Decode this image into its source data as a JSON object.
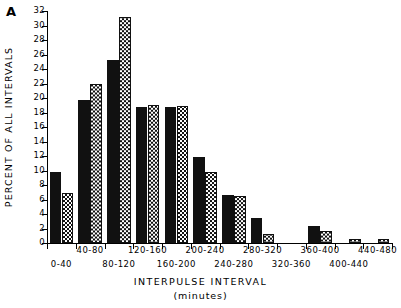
{
  "panel": {
    "label": "A"
  },
  "axes": {
    "ylabel": "PERCENT OF ALL INTERVALS",
    "xlabel": "INTERPULSE INTERVAL",
    "xlabel_units": "(minutes)"
  },
  "chart_data": {
    "type": "bar",
    "title": "A",
    "xlabel": "INTERPULSE INTERVAL (minutes)",
    "ylabel": "PERCENT OF ALL INTERVALS",
    "ylim": [
      0,
      32
    ],
    "yticks": [
      0,
      2,
      4,
      6,
      8,
      10,
      12,
      14,
      16,
      18,
      20,
      22,
      24,
      26,
      28,
      30,
      32
    ],
    "ytick_labels": [
      "0",
      "2",
      "4",
      "6",
      "8",
      "10",
      "12",
      "14",
      "16",
      "18",
      "20",
      "22",
      "24",
      "26",
      "28",
      "30",
      "32"
    ],
    "grid": false,
    "legend": null,
    "categories": [
      "0-40",
      "40-80",
      "80-120",
      "120-160",
      "160-200",
      "200-240",
      "240-280",
      "280-320",
      "320-360",
      "360-400",
      "400-440",
      "440-480"
    ],
    "series": [
      {
        "name": "solid",
        "fill": "solid-black",
        "values": [
          9.8,
          19.7,
          25.2,
          18.7,
          18.7,
          11.9,
          6.6,
          3.5,
          0.0,
          2.3,
          0.0,
          0.0
        ]
      },
      {
        "name": "hatched",
        "fill": "checkered",
        "values": [
          6.9,
          22.0,
          31.2,
          19.0,
          18.9,
          9.8,
          6.5,
          1.2,
          0.0,
          1.6,
          0.5,
          0.5
        ]
      }
    ]
  }
}
